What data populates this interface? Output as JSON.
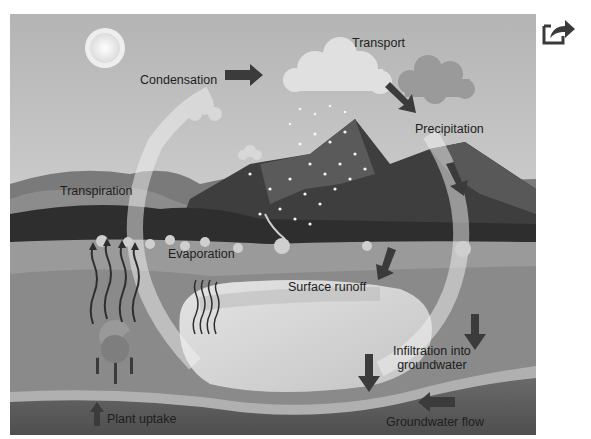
{
  "diagram": {
    "title_visible": false,
    "style": "grayscale",
    "labels": {
      "condensation": "Condensation",
      "transport": "Transport",
      "precipitation": "Precipitation",
      "transpiration": "Transpiration",
      "evaporation": "Evaporation",
      "surface_runoff": "Surface runoff",
      "infiltration_line1": "Infiltration into",
      "infiltration_line2": "groundwater",
      "groundwater_flow": "Groundwater flow",
      "plant_uptake": "Plant uptake"
    },
    "icons": {
      "share": "share-icon"
    },
    "colors": {
      "sky": "#bdbdbd",
      "sky_light": "#e2e2e2",
      "mountain_dark": "#3a3a3a",
      "mountain_mid": "#6a6a6a",
      "ground": "#9e9e9e",
      "lake": "#d6d6d6",
      "groundwater": "#5c5c5c",
      "arrow": "#3b3b3b",
      "text": "#1e1e1e"
    }
  }
}
